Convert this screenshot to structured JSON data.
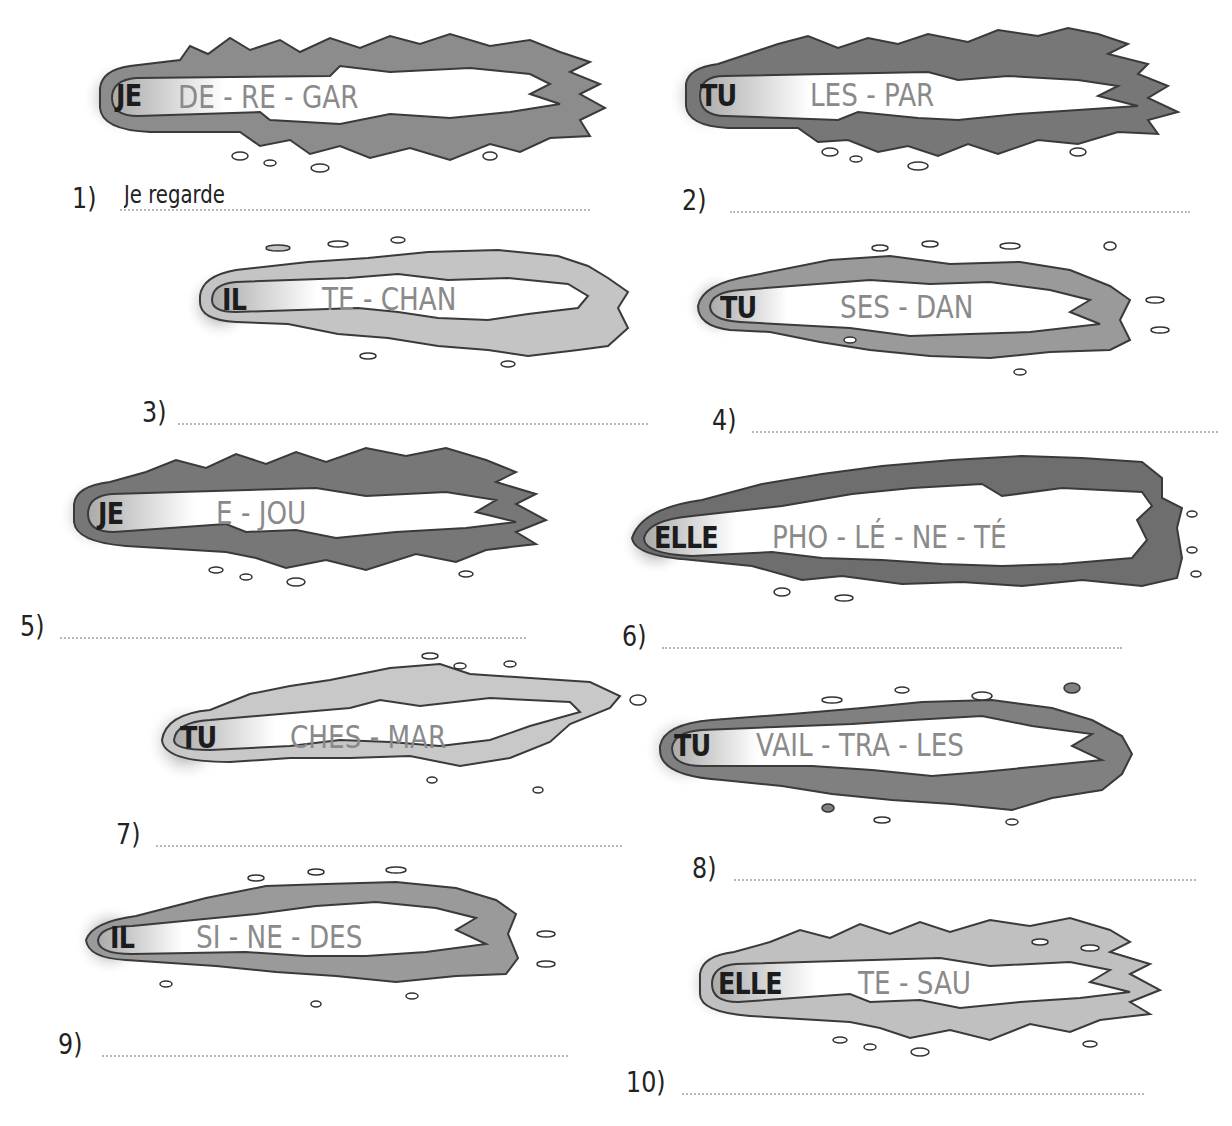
{
  "worksheet": {
    "exercises": [
      {
        "number": "1)",
        "pronoun": "JE",
        "syllables": "DE - RE - GAR",
        "answer": "Je regarde",
        "tail_color": "#8c8c8c"
      },
      {
        "number": "2)",
        "pronoun": "TU",
        "syllables": "LES - PAR",
        "answer": "",
        "tail_color": "#777777"
      },
      {
        "number": "3)",
        "pronoun": "IL",
        "syllables": "TE - CHAN",
        "answer": "",
        "tail_color": "#c4c4c4"
      },
      {
        "number": "4)",
        "pronoun": "TU",
        "syllables": "SES - DAN",
        "answer": "",
        "tail_color": "#9a9a9a"
      },
      {
        "number": "5)",
        "pronoun": "JE",
        "syllables": "E - JOU",
        "answer": "",
        "tail_color": "#777777"
      },
      {
        "number": "6)",
        "pronoun": "ELLE",
        "syllables": "PHO - LÉ - NE - TÉ",
        "answer": "",
        "tail_color": "#6e6e6e"
      },
      {
        "number": "7)",
        "pronoun": "TU",
        "syllables": "CHES - MAR",
        "answer": "",
        "tail_color": "#c8c8c8"
      },
      {
        "number": "8)",
        "pronoun": "TU",
        "syllables": "VAIL - TRA - LES",
        "answer": "",
        "tail_color": "#808080"
      },
      {
        "number": "9)",
        "pronoun": "IL",
        "syllables": "SI - NE - DES",
        "answer": "",
        "tail_color": "#9a9a9a"
      },
      {
        "number": "10)",
        "pronoun": "ELLE",
        "syllables": "TE - SAU",
        "answer": "",
        "tail_color": "#c0c0c0"
      }
    ]
  }
}
